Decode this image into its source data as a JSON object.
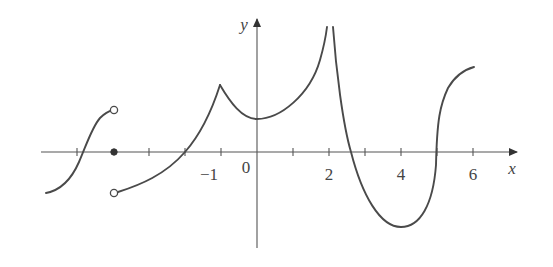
{
  "figure": {
    "axes": {
      "x_label": "x",
      "y_label": "y",
      "x_tick_labels": [
        {
          "value": -1,
          "text": "−1"
        },
        {
          "value": 0,
          "text": "0"
        },
        {
          "value": 2,
          "text": "2"
        },
        {
          "value": 4,
          "text": "4"
        },
        {
          "value": 6,
          "text": "6"
        }
      ],
      "x_ticks": [
        -5,
        -4,
        -3,
        -2,
        -1,
        1,
        2,
        3,
        4,
        5,
        6
      ]
    },
    "features": {
      "open_circles": [
        {
          "x": -4,
          "y": 1.15,
          "name": "left-limit-open-point-top"
        },
        {
          "x": -4,
          "y": -1.15,
          "name": "right-limit-open-point-bottom"
        }
      ],
      "closed_points": [
        {
          "x": -4,
          "y": 0,
          "name": "function-value-at-x-neg4"
        }
      ],
      "corner": {
        "x": -1,
        "y": 1.9
      },
      "local_min": {
        "x": 0,
        "y": 0.9
      },
      "vertical_asymptote": {
        "x": 2
      },
      "min": {
        "x": 4,
        "y": -2.1
      },
      "end_point": {
        "x": 6,
        "y": 2.35
      }
    },
    "colors": {
      "curve": "#4a4a4a",
      "axis": "#555555"
    }
  }
}
